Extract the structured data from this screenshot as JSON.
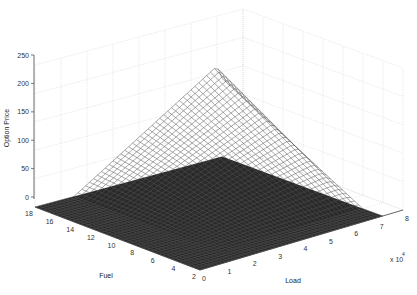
{
  "chart_data": {
    "type": "surface3d",
    "title": "",
    "xlabel": "Load",
    "ylabel": "Fuel",
    "zlabel": "Option Price",
    "x_multiplier_label": "x 10",
    "x_multiplier_exp": "4",
    "x_ticks": [
      "0",
      "1",
      "2",
      "3",
      "4",
      "5",
      "6",
      "7",
      "8"
    ],
    "y_ticks": [
      "2",
      "4",
      "6",
      "8",
      "10",
      "12",
      "14",
      "16",
      "18"
    ],
    "z_ticks": [
      "0",
      "50",
      "100",
      "150",
      "200",
      "250"
    ],
    "xlim": [
      0,
      80000
    ],
    "ylim": [
      2,
      18
    ],
    "zlim": [
      0,
      250
    ],
    "grid": true,
    "surface_description": "Mesh surface; near zero for low Load across all Fuel, rising roughly linearly with Load and Fuel to a peak of about 220 near Load=7e4, Fuel=18",
    "sample_points": [
      {
        "load": 0,
        "fuel": 2,
        "price": 0
      },
      {
        "load": 0,
        "fuel": 18,
        "price": 0
      },
      {
        "load": 80000,
        "fuel": 2,
        "price": 0
      },
      {
        "load": 40000,
        "fuel": 10,
        "price": 5
      },
      {
        "load": 60000,
        "fuel": 14,
        "price": 90
      },
      {
        "load": 70000,
        "fuel": 18,
        "price": 220
      },
      {
        "load": 50000,
        "fuel": 18,
        "price": 110
      },
      {
        "load": 70000,
        "fuel": 10,
        "price": 60
      }
    ],
    "peak": {
      "load": 70000,
      "fuel": 18,
      "price": 220
    }
  }
}
